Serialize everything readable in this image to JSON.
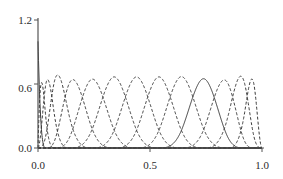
{
  "chart_data": {
    "type": "line",
    "title": "",
    "subtitle": "",
    "xlabel": "",
    "ylabel": "",
    "xlim": [
      0.0,
      1.0
    ],
    "ylim": [
      0.0,
      1.28
    ],
    "grid": false,
    "legend": null,
    "xticks": [
      0.0,
      0.5,
      1.0
    ],
    "xtick_labels": [
      "0.0",
      "0.5",
      "1.0"
    ],
    "yticks": [
      0.0,
      0.6,
      1.2
    ],
    "ytick_labels": [
      "0.0",
      "0.6",
      "1.2"
    ],
    "axis_color": "#555555",
    "curve_color": "#3a3a3a",
    "degree": 3,
    "knots": [
      0.0,
      0.0,
      0.0,
      0.0,
      0.035,
      0.075,
      0.14,
      0.24,
      0.34,
      0.44,
      0.54,
      0.64,
      0.74,
      0.845,
      0.92,
      0.965,
      1.0,
      1.0,
      1.0,
      1.0
    ],
    "series": [
      {
        "name": "B0",
        "style": "solid",
        "peak_x": 0.0,
        "peak_y": 1.0
      },
      {
        "name": "B1",
        "style": "dashed",
        "peak_x": 0.048,
        "peak_y": 0.63
      },
      {
        "name": "B2",
        "style": "dashed",
        "peak_x": 0.095,
        "peak_y": 0.6
      },
      {
        "name": "B3",
        "style": "dashed",
        "peak_x": 0.155,
        "peak_y": 0.58
      },
      {
        "name": "B4",
        "style": "dashed",
        "peak_x": 0.225,
        "peak_y": 0.655
      },
      {
        "name": "B5",
        "style": "dashed",
        "peak_x": 0.325,
        "peak_y": 0.655
      },
      {
        "name": "B6",
        "style": "dashed",
        "peak_x": 0.425,
        "peak_y": 0.655
      },
      {
        "name": "B7",
        "style": "dashed",
        "peak_x": 0.525,
        "peak_y": 0.655
      },
      {
        "name": "B8",
        "style": "dashed",
        "peak_x": 0.625,
        "peak_y": 0.655
      },
      {
        "name": "B9",
        "style": "dashed",
        "peak_x": 0.72,
        "peak_y": 0.655
      },
      {
        "name": "B10",
        "style": "solid",
        "peak_x": 0.8,
        "peak_y": 0.655
      },
      {
        "name": "B11",
        "style": "dashed",
        "peak_x": 0.88,
        "peak_y": 0.6
      },
      {
        "name": "B12",
        "style": "dashed",
        "peak_x": 0.945,
        "peak_y": 0.6
      },
      {
        "name": "B13",
        "style": "dashed",
        "peak_x": 1.0,
        "peak_y": 1.0
      }
    ]
  },
  "axes": {
    "y_labels": [
      "1.2",
      "0.6",
      "0.0"
    ],
    "x_labels": [
      "0.0",
      "0.5",
      "1.0"
    ]
  }
}
